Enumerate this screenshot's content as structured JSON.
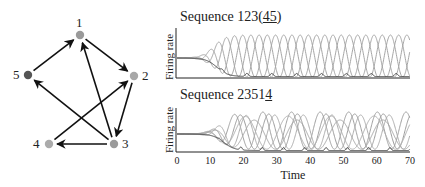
{
  "diagram": {
    "nodes": [
      {
        "id": "1",
        "x": 80,
        "y": 35,
        "color": "#9a9a9a",
        "label_dx": -4,
        "label_dy": -19
      },
      {
        "id": "2",
        "x": 134,
        "y": 76,
        "color": "#a8a8a8",
        "label_dx": 8,
        "label_dy": -7
      },
      {
        "id": "3",
        "x": 114,
        "y": 144,
        "color": "#9a9a9a",
        "label_dx": 8,
        "label_dy": -7
      },
      {
        "id": "4",
        "x": 49,
        "y": 144,
        "color": "#ababab",
        "label_dx": -16,
        "label_dy": -7
      },
      {
        "id": "5",
        "x": 28,
        "y": 75,
        "color": "#555555",
        "label_dx": -15,
        "label_dy": -7
      }
    ],
    "edges": [
      {
        "from": "1",
        "to": "2"
      },
      {
        "from": "2",
        "to": "3"
      },
      {
        "from": "3",
        "to": "1"
      },
      {
        "from": "3",
        "to": "4"
      },
      {
        "from": "3",
        "to": "5"
      },
      {
        "from": "4",
        "to": "2"
      },
      {
        "from": "5",
        "to": "1"
      }
    ]
  },
  "plots": {
    "top": {
      "title_prefix": "Sequence 123(",
      "title_underlined": "45",
      "title_suffix": ")",
      "ylabel": "Firing rate"
    },
    "bottom": {
      "title_prefix": "Sequence 2351",
      "title_underlined": "4",
      "title_suffix": "",
      "ylabel": "Firing rate"
    },
    "xlabel": "Time",
    "xticks": [
      "0",
      "10",
      "20",
      "30",
      "40",
      "50",
      "60",
      "70"
    ]
  },
  "chart_data": [
    {
      "type": "line",
      "title": "Sequence 123(45)",
      "xlabel": "",
      "ylabel": "Firing rate",
      "xlim": [
        0,
        70
      ],
      "grid": false,
      "series": [
        {
          "name": "neuron 1",
          "description": "oscillating, period ~7.5, large amplitude after t~12"
        },
        {
          "name": "neuron 2",
          "description": "oscillating, phase-shifted, large amplitude after t~12"
        },
        {
          "name": "neuron 3",
          "description": "oscillating, phase-shifted, large amplitude after t~12"
        },
        {
          "name": "neuron 4/5",
          "description": "near-zero with small bumps (dark curve)"
        }
      ],
      "notes": "All curves start at a common steady-state value, then diverge into a periodic 1-2-3 sequence."
    },
    {
      "type": "line",
      "title": "Sequence 23514",
      "xlabel": "Time",
      "ylabel": "Firing rate",
      "xlim": [
        0,
        70
      ],
      "xticks": [
        0,
        10,
        20,
        30,
        40,
        50,
        60,
        70
      ],
      "grid": false,
      "series": [
        {
          "name": "neuron 2"
        },
        {
          "name": "neuron 3"
        },
        {
          "name": "neuron 5"
        },
        {
          "name": "neuron 1"
        },
        {
          "name": "neuron 4"
        }
      ],
      "notes": "Curves start at common steady state, then diverge after t~10 into an irregular 2-3-5-1-4 sequence."
    }
  ]
}
